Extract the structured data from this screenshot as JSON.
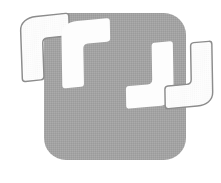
{
  "image": {
    "kind": "decorative-graphic",
    "subject": "quotation-marks",
    "title": "Quotation mark graphic",
    "description": "Gray rounded square panel with four large white quotation mark glyphs overlaid",
    "canvas_width": 221,
    "canvas_height": 183,
    "background_color": "#ffffff"
  },
  "panel": {
    "name": "rounded square panel",
    "fill_color": "#a3a3a3",
    "texture": "halftone dither",
    "x": 44,
    "y": 13,
    "width": 142,
    "height": 147,
    "corner_radius": 22
  },
  "glyphs": [
    {
      "label": "opening quote outer",
      "character": "“",
      "style": "outlined",
      "fill_color": "#fdfdfd",
      "stroke_color": "#8c8c8c",
      "role": "open-left"
    },
    {
      "label": "opening quote inner",
      "character": "“",
      "style": "solid",
      "fill_color": "#fdfdfd",
      "stroke_color": "none",
      "role": "open-right"
    },
    {
      "label": "closing quote inner",
      "character": "”",
      "style": "solid",
      "fill_color": "#fdfdfd",
      "stroke_color": "none",
      "role": "close-left"
    },
    {
      "label": "closing quote outer",
      "character": "”",
      "style": "outlined",
      "fill_color": "#fdfdfd",
      "stroke_color": "#8c8c8c",
      "role": "close-right"
    }
  ],
  "palette": {
    "panel_gray": "#a3a3a3",
    "glyph_white": "#fdfdfd",
    "outline_gray": "#8c8c8c",
    "page_white": "#ffffff"
  }
}
